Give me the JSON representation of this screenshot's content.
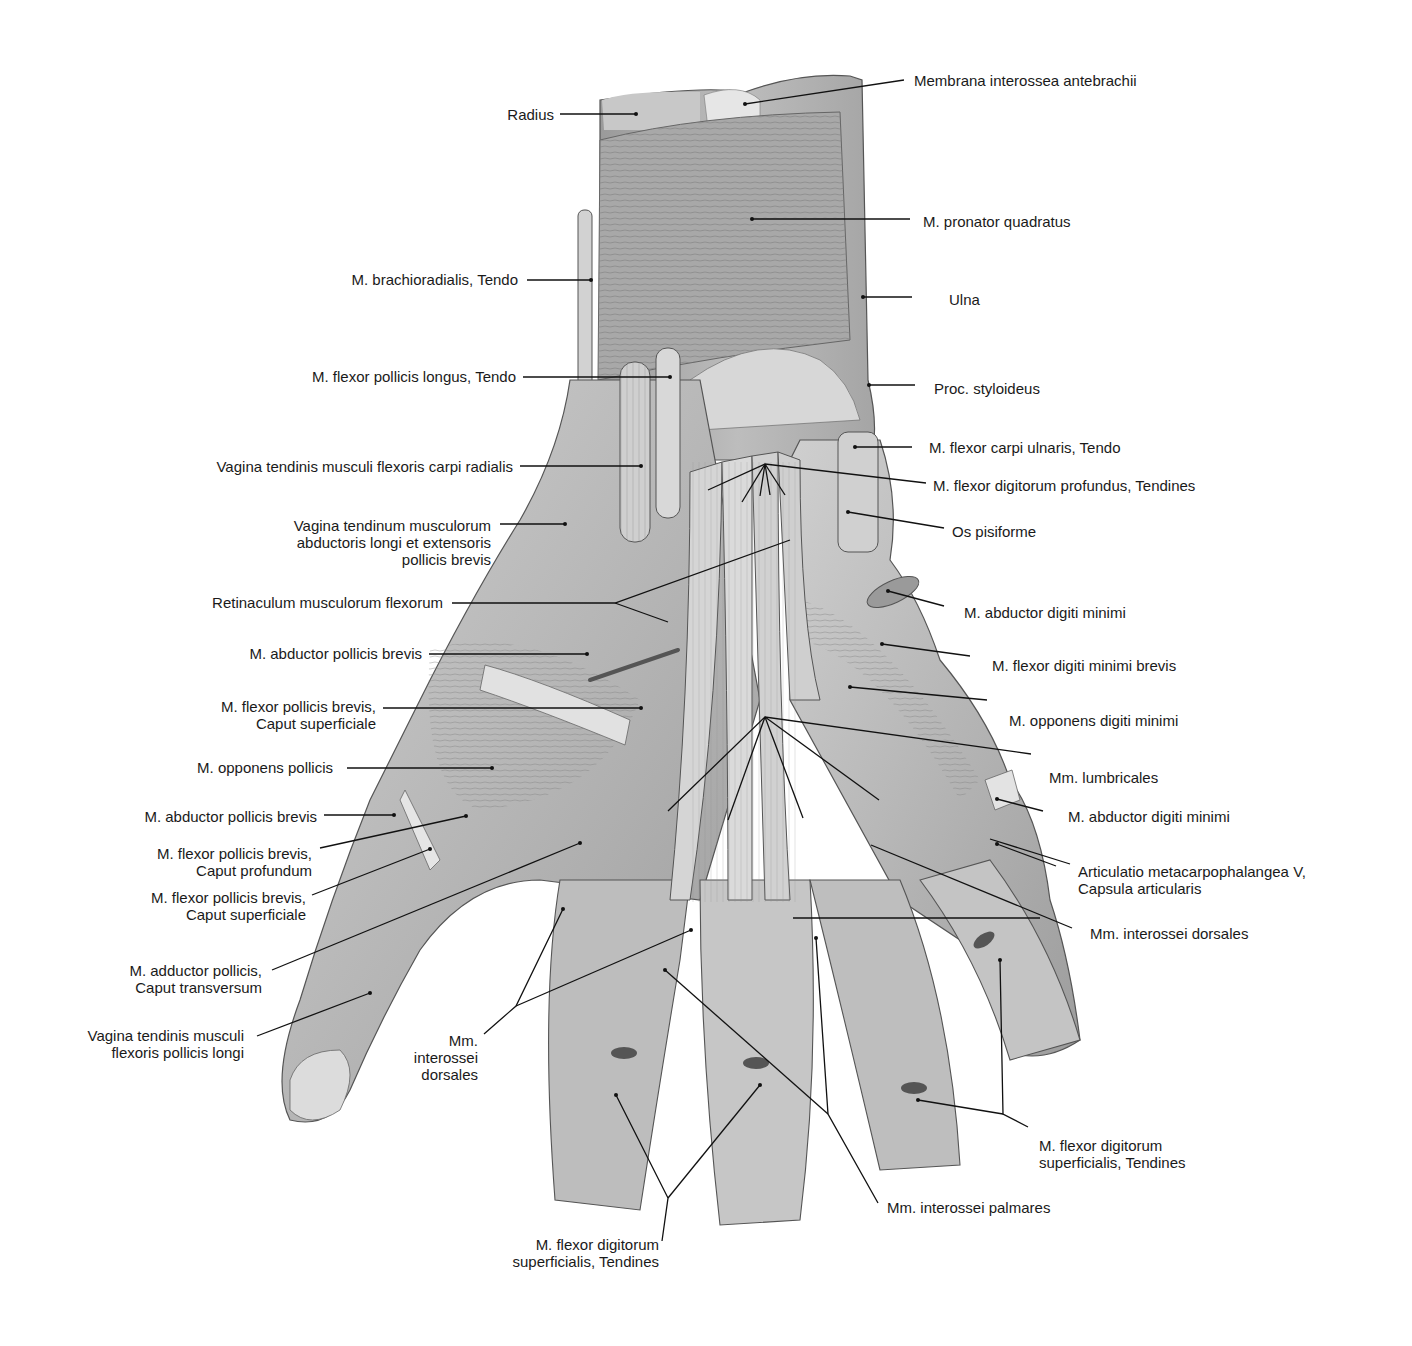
{
  "figure": {
    "colors": {
      "background": "#ffffff",
      "ink": "#1a1a1a",
      "tissue_light": "#d9d9d9",
      "tissue_mid": "#b0b0b0",
      "tissue_dark": "#7a7a7a"
    }
  },
  "labels_left": [
    {
      "id": "radius",
      "lines": [
        "Radius"
      ]
    },
    {
      "id": "brachioradialis",
      "lines": [
        "M. brachioradialis, Tendo"
      ]
    },
    {
      "id": "fpl-tendo",
      "lines": [
        "M. flexor pollicis longus, Tendo"
      ]
    },
    {
      "id": "vagina-fcr",
      "lines": [
        "Vagina tendinis musculi flexoris carpi radialis"
      ]
    },
    {
      "id": "vagina-abductoris",
      "lines": [
        "Vagina tendinum musculorum",
        "abductoris longi et extensoris",
        "pollicis brevis"
      ]
    },
    {
      "id": "retinaculum",
      "lines": [
        "Retinaculum musculorum flexorum"
      ]
    },
    {
      "id": "apb-1",
      "lines": [
        "M. abductor pollicis brevis"
      ]
    },
    {
      "id": "fpb-sup-1",
      "lines": [
        "M. flexor pollicis brevis,",
        "Caput superficiale"
      ]
    },
    {
      "id": "opponens-pollicis",
      "lines": [
        "M. opponens pollicis"
      ]
    },
    {
      "id": "apb-2",
      "lines": [
        "M. abductor pollicis brevis"
      ]
    },
    {
      "id": "fpb-prof",
      "lines": [
        "M. flexor pollicis brevis,",
        "Caput profundum"
      ]
    },
    {
      "id": "fpb-sup-2",
      "lines": [
        "M. flexor pollicis brevis,",
        "Caput superficiale"
      ]
    },
    {
      "id": "adductor-pollicis",
      "lines": [
        "M. adductor pollicis,",
        "Caput transversum"
      ]
    },
    {
      "id": "vagina-fpl",
      "lines": [
        "Vagina tendinis musculi",
        "flexoris pollicis longi"
      ]
    },
    {
      "id": "interossei-dorsales-left",
      "lines": [
        "Mm.",
        "interossei",
        "dorsales"
      ]
    },
    {
      "id": "fds-tendines-bottom",
      "lines": [
        "M. flexor digitorum",
        "superficialis, Tendines"
      ]
    }
  ],
  "labels_right": [
    {
      "id": "membrana",
      "lines": [
        "Membrana interossea antebrachii"
      ]
    },
    {
      "id": "pronator",
      "lines": [
        "M. pronator quadratus"
      ]
    },
    {
      "id": "ulna",
      "lines": [
        "Ulna"
      ]
    },
    {
      "id": "styloideus",
      "lines": [
        "Proc. styloideus"
      ]
    },
    {
      "id": "fcu-tendo",
      "lines": [
        "M. flexor carpi ulnaris, Tendo"
      ]
    },
    {
      "id": "fdp-tendines",
      "lines": [
        "M. flexor digitorum profundus, Tendines"
      ]
    },
    {
      "id": "pisiforme",
      "lines": [
        "Os pisiforme"
      ]
    },
    {
      "id": "adm-1",
      "lines": [
        "M. abductor digiti minimi"
      ]
    },
    {
      "id": "fdmb",
      "lines": [
        "M. flexor digiti minimi brevis"
      ]
    },
    {
      "id": "odm",
      "lines": [
        "M. opponens digiti minimi"
      ]
    },
    {
      "id": "lumbricales",
      "lines": [
        "Mm. lumbricales"
      ]
    },
    {
      "id": "adm-2",
      "lines": [
        "M. abductor digiti minimi"
      ]
    },
    {
      "id": "articulatio",
      "lines": [
        "Articulatio metacarpophalangea V,",
        "Capsula articularis"
      ]
    },
    {
      "id": "interossei-dorsales-right",
      "lines": [
        "Mm. interossei dorsales"
      ]
    },
    {
      "id": "fds-tendines-right",
      "lines": [
        "M. flexor digitorum",
        "superficialis, Tendines"
      ]
    },
    {
      "id": "interossei-palmares",
      "lines": [
        "Mm. interossei palmares"
      ]
    }
  ]
}
